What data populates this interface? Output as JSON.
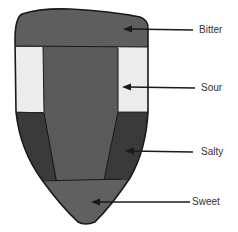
{
  "diagram": {
    "colors": {
      "outline": "#1a1a1a",
      "bitter": "#5e5e5e",
      "sour_sides": "#ececec",
      "center": "#5a5a5a",
      "salty_sides": "#3a3a3a",
      "sweet": "#606060",
      "arrow": "#1a1a1a",
      "text": "#333333"
    },
    "regions": [
      {
        "name": "Bitter",
        "position": "back"
      },
      {
        "name": "Sour",
        "position": "sides-rear"
      },
      {
        "name": "Salty",
        "position": "sides-front"
      },
      {
        "name": "Sweet",
        "position": "tip"
      }
    ],
    "labels": {
      "bitter": "Bitter",
      "sour": "Sour",
      "salty": "Salty",
      "sweet": "Sweet"
    }
  }
}
